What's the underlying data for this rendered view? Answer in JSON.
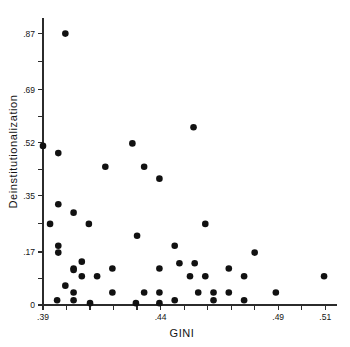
{
  "chart_data": {
    "type": "scatter",
    "title": "",
    "xlabel": "GINI",
    "ylabel": "Deinstitutionalization",
    "xlim": [
      0.39,
      0.515
    ],
    "ylim": [
      0.0,
      0.92
    ],
    "grid": false,
    "legend": null,
    "xticks": [
      0.39,
      0.4,
      0.41,
      0.42,
      0.43,
      0.44,
      0.45,
      0.46,
      0.47,
      0.48,
      0.49,
      0.5,
      0.51
    ],
    "xtick_labels": [
      ".39",
      "",
      "",
      "",
      "",
      ".44",
      "",
      "",
      "",
      "",
      ".49",
      "",
      ".51"
    ],
    "yticks": [
      0.0,
      0.085,
      0.17,
      0.26,
      0.35,
      0.435,
      0.52,
      0.605,
      0.69,
      0.78,
      0.87
    ],
    "ytick_labels": [
      "0",
      "",
      ".17",
      "",
      ".35",
      "",
      ".52",
      "",
      ".69",
      "",
      ".87"
    ],
    "marker": "filled-circle",
    "marker_color": "#111111",
    "marker_size": 3.3,
    "points": [
      {
        "x": 0.3995,
        "y": 0.87
      },
      {
        "x": 0.39,
        "y": 0.51
      },
      {
        "x": 0.454,
        "y": 0.57
      },
      {
        "x": 0.428,
        "y": 0.518
      },
      {
        "x": 0.3965,
        "y": 0.487
      },
      {
        "x": 0.4165,
        "y": 0.443
      },
      {
        "x": 0.433,
        "y": 0.443
      },
      {
        "x": 0.4395,
        "y": 0.405
      },
      {
        "x": 0.3965,
        "y": 0.323
      },
      {
        "x": 0.403,
        "y": 0.296
      },
      {
        "x": 0.393,
        "y": 0.26
      },
      {
        "x": 0.4095,
        "y": 0.26
      },
      {
        "x": 0.459,
        "y": 0.26
      },
      {
        "x": 0.43,
        "y": 0.222
      },
      {
        "x": 0.3965,
        "y": 0.19
      },
      {
        "x": 0.446,
        "y": 0.19
      },
      {
        "x": 0.3965,
        "y": 0.168
      },
      {
        "x": 0.48,
        "y": 0.168
      },
      {
        "x": 0.4065,
        "y": 0.139
      },
      {
        "x": 0.448,
        "y": 0.134
      },
      {
        "x": 0.4545,
        "y": 0.134
      },
      {
        "x": 0.403,
        "y": 0.117
      },
      {
        "x": 0.403,
        "y": 0.112
      },
      {
        "x": 0.4195,
        "y": 0.117
      },
      {
        "x": 0.4395,
        "y": 0.117
      },
      {
        "x": 0.469,
        "y": 0.117
      },
      {
        "x": 0.4065,
        "y": 0.092
      },
      {
        "x": 0.413,
        "y": 0.092
      },
      {
        "x": 0.4525,
        "y": 0.092
      },
      {
        "x": 0.459,
        "y": 0.092
      },
      {
        "x": 0.4755,
        "y": 0.092
      },
      {
        "x": 0.5095,
        "y": 0.092
      },
      {
        "x": 0.3995,
        "y": 0.062
      },
      {
        "x": 0.403,
        "y": 0.04
      },
      {
        "x": 0.4195,
        "y": 0.04
      },
      {
        "x": 0.433,
        "y": 0.04
      },
      {
        "x": 0.4395,
        "y": 0.04
      },
      {
        "x": 0.456,
        "y": 0.04
      },
      {
        "x": 0.4625,
        "y": 0.04
      },
      {
        "x": 0.469,
        "y": 0.04
      },
      {
        "x": 0.489,
        "y": 0.04
      },
      {
        "x": 0.396,
        "y": 0.015
      },
      {
        "x": 0.403,
        "y": 0.015
      },
      {
        "x": 0.4395,
        "y": 0.006
      },
      {
        "x": 0.446,
        "y": 0.015
      },
      {
        "x": 0.4625,
        "y": 0.015
      },
      {
        "x": 0.4755,
        "y": 0.015
      },
      {
        "x": 0.4295,
        "y": 0.006
      },
      {
        "x": 0.41,
        "y": 0.006
      }
    ]
  }
}
